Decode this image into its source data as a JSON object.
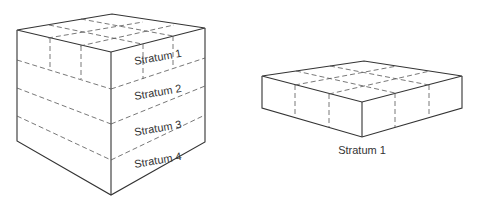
{
  "diagram": {
    "cube": {
      "strata_labels": [
        "Stratum 1",
        "Stratum 2",
        "Stratum 3",
        "Stratum 4"
      ],
      "strata_count": 4,
      "grid": "3x3"
    },
    "slab": {
      "caption": "Stratum 1",
      "grid": "3x3"
    }
  }
}
